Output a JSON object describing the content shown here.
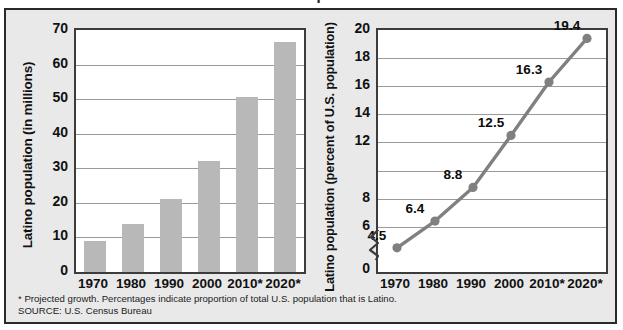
{
  "figure": {
    "clipped_title": "Latino Population"
  },
  "footnote": {
    "line1": "* Projected growth. Percentages indicate proportion of total U.S. population that is Latino.",
    "line2": "SOURCE: U.S. Census Bureau"
  },
  "colors": {
    "bar_fill": "#b8b8b8",
    "line": "#808080",
    "marker": "#808080",
    "gridline": "#9a9a9a",
    "plot_border": "#3c3c3c",
    "card_background": "#e9e9e9",
    "text": "#111111"
  },
  "chart_data": [
    {
      "type": "bar",
      "title": "",
      "xlabel": "",
      "ylabel": "Latino population (in millions)",
      "categories": [
        "1970",
        "1980",
        "1990",
        "2000",
        "2010*",
        "2020*"
      ],
      "values": [
        9,
        14,
        21,
        32,
        50.5,
        66.5
      ],
      "ylim": [
        0,
        70
      ],
      "yticks": [
        0,
        10,
        20,
        30,
        40,
        50,
        60,
        70
      ],
      "yticklabels": [
        "0",
        "10",
        "20",
        "30",
        "40",
        "50",
        "60",
        "70"
      ],
      "grid": true,
      "legend": "none"
    },
    {
      "type": "line",
      "title": "",
      "xlabel": "",
      "ylabel": "Latino population (percent of U.S. population)",
      "categories": [
        "1970",
        "1980",
        "1990",
        "2000",
        "2010*",
        "2020*"
      ],
      "values": [
        4.5,
        6.4,
        8.8,
        12.5,
        16.3,
        19.4
      ],
      "data_labels": [
        "4.5",
        "6.4",
        "8.8",
        "12.5",
        "16.3",
        "19.4"
      ],
      "ylim": [
        5.2,
        20
      ],
      "yticks": [
        6,
        8,
        10,
        12,
        14,
        16,
        18,
        20
      ],
      "yticklabels": [
        "6",
        "8",
        "",
        "12",
        "14",
        "16",
        "18",
        "20"
      ],
      "axis_break": true,
      "axis_break_baseline_label": "0",
      "grid": true,
      "legend": "none"
    }
  ]
}
